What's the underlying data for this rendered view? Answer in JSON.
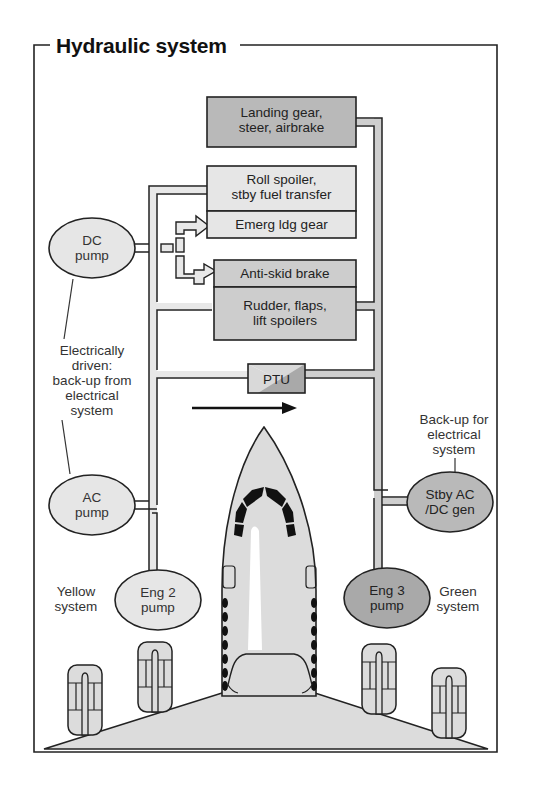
{
  "title": "Hydraulic system",
  "colors": {
    "frame": "#222222",
    "pipe_fill": "#e2e2e2",
    "light_box": "#e6e6e6",
    "medium_box": "#cdcdcd",
    "dark_box": "#b9b9b9",
    "ptu_light": "#d9d9d9",
    "ptu_dark": "#a9a9a9",
    "aircraft_fill": "#dcdcdc",
    "windscreen": "#111111"
  },
  "consumers": [
    {
      "id": "landing-gear",
      "label": "Landing gear,\nsteer, airbrake",
      "shade": "dark"
    },
    {
      "id": "roll-spoiler",
      "label": "Roll spoiler,\nstby fuel transfer",
      "shade": "light"
    },
    {
      "id": "emerg-ldg-gear",
      "label": "Emerg ldg gear",
      "shade": "light"
    },
    {
      "id": "anti-skid-brake",
      "label": "Anti-skid brake",
      "shade": "medium"
    },
    {
      "id": "rudder-flaps",
      "label": "Rudder, flaps,\nlift spoilers",
      "shade": "medium"
    }
  ],
  "ptu": {
    "label": "PTU"
  },
  "pumps": [
    {
      "id": "dc-pump",
      "label": "DC\npump",
      "system": "yellow"
    },
    {
      "id": "ac-pump",
      "label": "AC\npump",
      "system": "yellow"
    },
    {
      "id": "eng2-pump",
      "label": "Eng 2\npump",
      "system": "yellow"
    },
    {
      "id": "eng3-pump",
      "label": "Eng 3\npump",
      "system": "green"
    },
    {
      "id": "stby-gen",
      "label": "Stby AC\n/DC gen",
      "system": "green"
    }
  ],
  "annotations": {
    "electric": "Electrically\ndriven:\nback-up from\nelectrical\nsystem",
    "backup": "Back-up for\nelectrical\nsystem",
    "yellow_system": "Yellow\nsystem",
    "green_system": "Green\nsystem"
  },
  "flow_arrow": {
    "direction": "right",
    "meaning": "PTU transfer direction"
  }
}
